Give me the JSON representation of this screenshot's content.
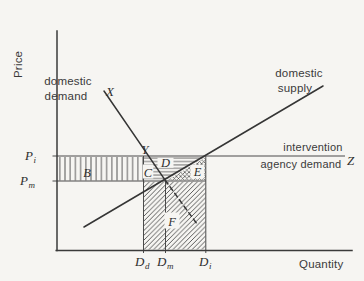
{
  "colors": {
    "ink": "#3a3a3a",
    "paper": "#f6f5f2"
  },
  "axes": {
    "y_label": "Price",
    "x_label": "Quantity"
  },
  "curve_labels": {
    "demand": [
      "domestic",
      "demand"
    ],
    "supply": [
      "domestic",
      "supply"
    ],
    "intervention": [
      "intervention",
      "agency demand"
    ]
  },
  "points": {
    "x": "X",
    "y": "Y",
    "z": "Z"
  },
  "axis_points": {
    "p_i": {
      "base": "P",
      "sub": "i"
    },
    "p_m": {
      "base": "P",
      "sub": "m"
    },
    "d_d": {
      "base": "D",
      "sub": "d"
    },
    "d_m": {
      "base": "D",
      "sub": "m"
    },
    "d_i": {
      "base": "D",
      "sub": "i"
    }
  },
  "regions": {
    "b": "B",
    "c": "C",
    "d": "D",
    "e": "E",
    "f": "F"
  }
}
